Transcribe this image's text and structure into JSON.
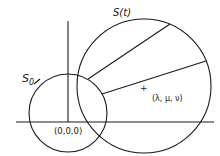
{
  "diagram": {
    "colors": {
      "ink": "#1a1a1a",
      "background": "#ffffff"
    },
    "labels": {
      "small_sphere": "S",
      "small_sphere_sub": "0",
      "large_sphere": "S(t)",
      "center_point": "(λ, μ, ν)",
      "origin": "(0,0,0)",
      "center_marker": "+"
    },
    "shapes": {
      "small_circle": {
        "cx": 68,
        "cy": 113,
        "r": 39
      },
      "large_circle": {
        "cx": 144,
        "cy": 86,
        "r": 67
      },
      "x_axis": {
        "x1": 16,
        "y1": 122,
        "x2": 214,
        "y2": 122
      },
      "y_axis": {
        "x1": 68,
        "y1": 21,
        "x2": 68,
        "y2": 122
      },
      "radial_lines": [
        {
          "x1": 88,
          "y1": 79,
          "x2": 170,
          "y2": 24
        },
        {
          "x1": 102,
          "y1": 94,
          "x2": 206,
          "y2": 61
        }
      ]
    }
  }
}
